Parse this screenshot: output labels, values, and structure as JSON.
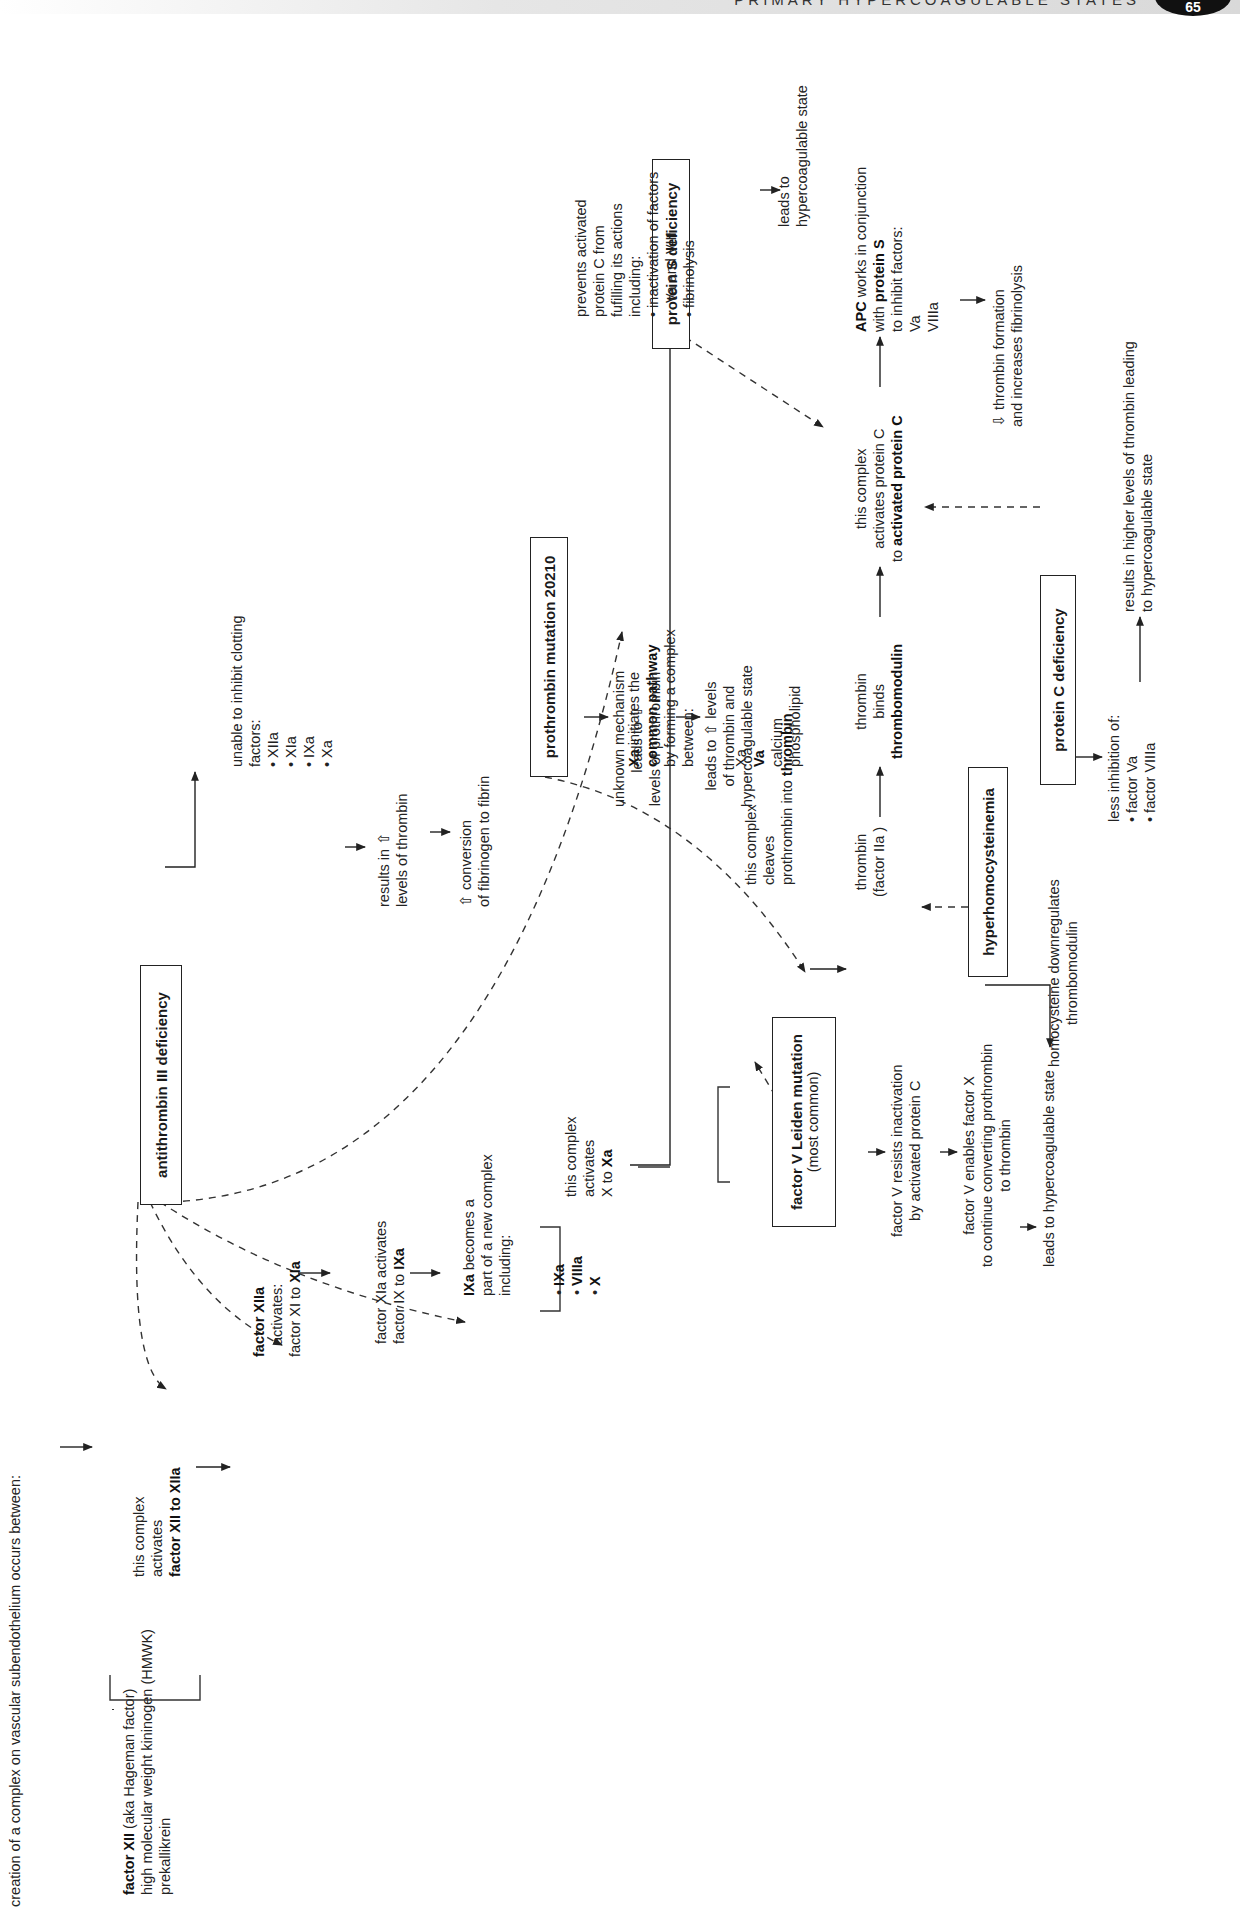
{
  "header": {
    "title": "PRIMARY HYPERCOAGULABLE STATES",
    "page_number": "65"
  },
  "diagram": {
    "start": {
      "creation": "creation of a complex on vascular subendothelium occurs between:",
      "factor_xii": "factor XII",
      "factor_xii_aka": "(aka Hageman factor)",
      "hmwk": "high molecular weight kininogen (HMWK)",
      "prekallikrein": "prekallikrein"
    },
    "complex1": {
      "line1": "this complex",
      "line2": "activates",
      "line3": "factor XII to XIIa"
    },
    "factor_xiia": {
      "line1": "factor XIIa",
      "line2": "activates:",
      "line3a": "factor XI to ",
      "line3b": "XIa"
    },
    "factor_xia": {
      "line1": "factor XIa activates",
      "line2a": "factor IX to ",
      "line2b": "IXa"
    },
    "ixa_complex": {
      "line1a": "IXa",
      "line1b": " becomes a",
      "line2": "part of a new complex",
      "line3": "including:",
      "items": [
        "IXa",
        "VIIIa",
        "X"
      ]
    },
    "complex2": {
      "line1": "this complex",
      "line2": "activates",
      "line3a": "X to ",
      "line3b": "Xa"
    },
    "xa_common": {
      "line1a": "Xa",
      "line1b": " initiates the",
      "line2": "common pathway",
      "line3": "by forming a complex",
      "line4": "between:"
    },
    "prothrombinase": {
      "items": [
        "Xa",
        "Va",
        "calcium",
        "phospholipid"
      ],
      "cleaves1": "this complex",
      "cleaves2": "cleaves",
      "cleaves3a": "prothrombin into ",
      "cleaves3b": "thrombin"
    },
    "thrombin": {
      "line1": "thrombin",
      "line2": "(factor IIa )"
    },
    "thrombin_binds": {
      "line1": "thrombin",
      "line2": "binds",
      "line3": "thrombomodulin"
    },
    "activates_pc": {
      "line1": "this complex",
      "line2": "activates protein C",
      "line3a": "to ",
      "line3b": "activated protein C"
    },
    "apc": {
      "line1a": "APC",
      "line1b": " works in conjunction",
      "line2a": "with ",
      "line2b": "protein S",
      "line3": "to inhibit factors:",
      "items": [
        "Va",
        "VIIIa"
      ]
    },
    "apc_result": {
      "line1": "⇩ thrombin formation",
      "line2": "and increases fibrinolysis"
    },
    "antithrombin": {
      "box": "antithrombin III deficiency",
      "effect_title": "unable to inhibit clotting",
      "effect_sub": "factors:",
      "items": [
        "XIIa",
        "XIa",
        "IXa",
        "Xa"
      ],
      "result1": "results in ⇧",
      "result2": "levels of thrombin",
      "final1": "⇧ conversion",
      "final2": "of fibrinogen to fibrin"
    },
    "factor_v_leiden": {
      "box": "factor V Leiden mutation",
      "box_sub": "(most common)",
      "step1a": "factor V resists inactivation",
      "step1b": "by activated protein C",
      "step2a": "factor V enables factor X",
      "step2b": "to continue converting prothrombin",
      "step2c": "to thrombin",
      "step3": "leads to hypercoagulable state"
    },
    "prothrombin_mutation": {
      "box": "prothrombin mutation 20210",
      "step1a": "unknown mechanism",
      "step1b": "leads to ⇧",
      "step1c": "levels of prothrombin",
      "step2a": "leads to ⇧ levels",
      "step2b": "of thrombin and",
      "step2c": "hypercoagulable state"
    },
    "hyperhomocysteinemia": {
      "box": "hyperhomocysteinemia",
      "effect1": "homocysteine downregulates",
      "effect2": "thrombomodulin"
    },
    "protein_c_deficiency": {
      "box": "protein C deficiency",
      "effect_title": "less inhibition of:",
      "items": [
        "factor Va",
        "factor VIIIa"
      ],
      "result1": "results in higher levels of thrombin leading",
      "result2": "to hypercoagulable state"
    },
    "protein_s_deficiency": {
      "box": "protein S deficiency",
      "effect1": "prevents activated",
      "effect2": "protein C from",
      "effect3": "fufilling its actions",
      "effect4": "including:",
      "effect5": "• inactivation of factors",
      "effect6": "Va and VIII",
      "effect7": "• fibrinolysis",
      "result1": "leads to",
      "result2": "hypercoagulable state"
    }
  }
}
